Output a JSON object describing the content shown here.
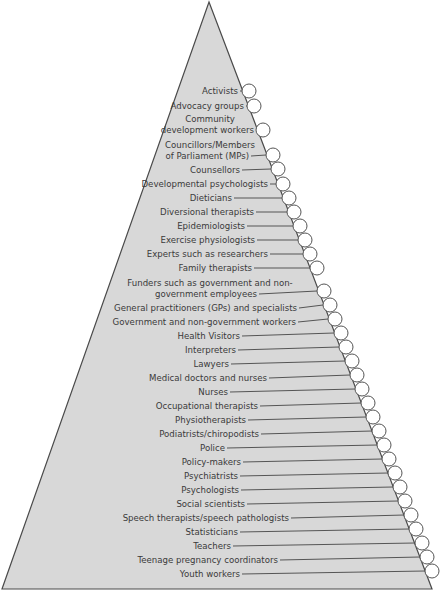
{
  "diagram": {
    "type": "pyramid",
    "colors": {
      "fill": "#d8d8d8",
      "stroke": "#4a4a4a",
      "text": "#3a3a3a",
      "circle_fill": "#ffffff",
      "circle_stroke": "#555555",
      "leader": "#555555"
    },
    "triangle": {
      "apex": [
        209,
        2
      ],
      "base_left": [
        2,
        589
      ],
      "base_right": [
        432,
        589
      ]
    },
    "circle_radius": 7,
    "items": [
      {
        "lines": [
          "Activists"
        ],
        "y": 91,
        "cx": 249,
        "cy": 91,
        "text_end": 238
      },
      {
        "lines": [
          "Advocacy groups"
        ],
        "y": 106,
        "cx": 254,
        "cy": 106,
        "text_end": 244
      },
      {
        "lines": [
          "Community",
          "development workers"
        ],
        "y": 130,
        "cx": 263,
        "cy": 130,
        "text_end": 254
      },
      {
        "lines": [
          "Councillors/Members",
          "of Parliament (MPs)"
        ],
        "y": 156,
        "cx": 273,
        "cy": 155,
        "text_end": 249
      },
      {
        "lines": [
          "Counsellors"
        ],
        "y": 170,
        "cx": 278,
        "cy": 169,
        "text_end": 240
      },
      {
        "lines": [
          "Developmental psychologists"
        ],
        "y": 184,
        "cx": 283,
        "cy": 184,
        "text_end": 268
      },
      {
        "lines": [
          "Dieticians"
        ],
        "y": 198,
        "cx": 289,
        "cy": 198,
        "text_end": 232
      },
      {
        "lines": [
          "Diversional therapists"
        ],
        "y": 212,
        "cx": 294,
        "cy": 212,
        "text_end": 254
      },
      {
        "lines": [
          "Epidemiologists"
        ],
        "y": 226,
        "cx": 300,
        "cy": 226,
        "text_end": 245
      },
      {
        "lines": [
          "Exercise physiologists"
        ],
        "y": 240,
        "cx": 305,
        "cy": 240,
        "text_end": 255
      },
      {
        "lines": [
          "Experts such as researchers"
        ],
        "y": 254,
        "cx": 310,
        "cy": 254,
        "text_end": 268
      },
      {
        "lines": [
          "Family therapists"
        ],
        "y": 268,
        "cx": 317,
        "cy": 268,
        "text_end": 252
      },
      {
        "lines": [
          "Funders such as government and non-",
          "government employees"
        ],
        "y": 294,
        "cx": 324,
        "cy": 291,
        "text_end": 257
      },
      {
        "lines": [
          "General practitioners (GPs) and specialists"
        ],
        "y": 308,
        "cx": 330,
        "cy": 305,
        "text_end": 297
      },
      {
        "lines": [
          "Government and non-government workers"
        ],
        "y": 322,
        "cx": 335,
        "cy": 319,
        "text_end": 296
      },
      {
        "lines": [
          "Health Visitors"
        ],
        "y": 336,
        "cx": 341,
        "cy": 333,
        "text_end": 240
      },
      {
        "lines": [
          "Interpreters"
        ],
        "y": 350,
        "cx": 346,
        "cy": 347,
        "text_end": 236
      },
      {
        "lines": [
          "Lawyers"
        ],
        "y": 364,
        "cx": 352,
        "cy": 361,
        "text_end": 229
      },
      {
        "lines": [
          "Medical doctors and nurses"
        ],
        "y": 378,
        "cx": 357,
        "cy": 375,
        "text_end": 267
      },
      {
        "lines": [
          "Nurses"
        ],
        "y": 392,
        "cx": 362,
        "cy": 389,
        "text_end": 228
      },
      {
        "lines": [
          "Occupational therapists"
        ],
        "y": 406,
        "cx": 368,
        "cy": 403,
        "text_end": 258
      },
      {
        "lines": [
          "Physiotherapists"
        ],
        "y": 420,
        "cx": 373,
        "cy": 417,
        "text_end": 246
      },
      {
        "lines": [
          "Podiatrists/chiropodists"
        ],
        "y": 434,
        "cx": 379,
        "cy": 431,
        "text_end": 259
      },
      {
        "lines": [
          "Police"
        ],
        "y": 448,
        "cx": 384,
        "cy": 445,
        "text_end": 225
      },
      {
        "lines": [
          "Policy-makers"
        ],
        "y": 462,
        "cx": 389,
        "cy": 459,
        "text_end": 241
      },
      {
        "lines": [
          "Psychiatrists"
        ],
        "y": 476,
        "cx": 395,
        "cy": 473,
        "text_end": 238
      },
      {
        "lines": [
          "Psychologists"
        ],
        "y": 490,
        "cx": 400,
        "cy": 487,
        "text_end": 239
      },
      {
        "lines": [
          "Social scientists"
        ],
        "y": 504,
        "cx": 405,
        "cy": 501,
        "text_end": 245
      },
      {
        "lines": [
          "Speech therapists/speech pathologists"
        ],
        "y": 518,
        "cx": 411,
        "cy": 515,
        "text_end": 289
      },
      {
        "lines": [
          "Statisticians"
        ],
        "y": 532,
        "cx": 416,
        "cy": 529,
        "text_end": 238
      },
      {
        "lines": [
          "Teachers"
        ],
        "y": 546,
        "cx": 422,
        "cy": 543,
        "text_end": 231
      },
      {
        "lines": [
          "Teenage pregnancy coordinators"
        ],
        "y": 560,
        "cx": 427,
        "cy": 557,
        "text_end": 278
      },
      {
        "lines": [
          "Youth workers"
        ],
        "y": 574,
        "cx": 432,
        "cy": 571,
        "text_end": 240
      }
    ]
  }
}
